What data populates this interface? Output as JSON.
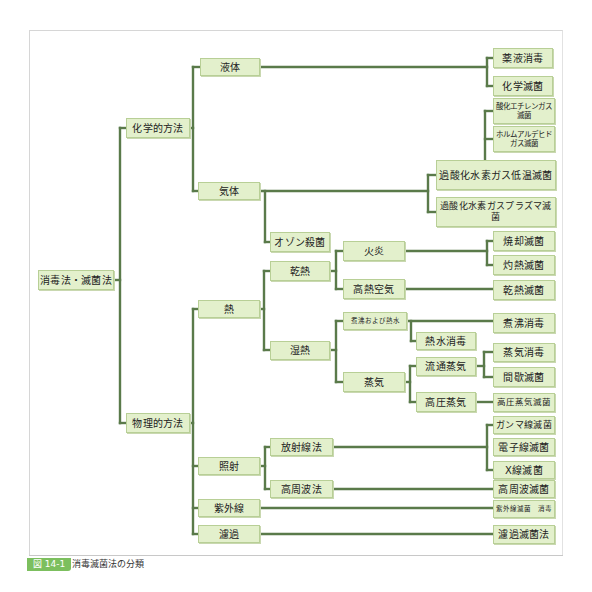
{
  "figure": {
    "caption_label": "図 14-1",
    "caption_title": "消毒滅菌法の分類"
  },
  "colors": {
    "line": "#5a7a4a",
    "node_fill": "#e3f0cc",
    "node_border": "#b8cf96",
    "caption_badge": "#7cbf5e"
  },
  "tree": {
    "root": "消毒法・滅菌法",
    "chemical": "化学的方法",
    "physical": "物理的方法",
    "liquid": "液体",
    "gas": "気体",
    "chem_disinfect": "薬液消毒",
    "chem_sterilize": "化学滅菌",
    "eo_gas": "酸化エチレンガス\n滅菌",
    "formaldehyde": "ホルムアルデヒド\nガス滅菌",
    "h2o2_lowtemp": "過酸化水素ガス低温滅菌",
    "h2o2_plasma": "過酸化水素ガスプラズマ滅菌",
    "ozone": "オゾン殺菌",
    "heat": "熱",
    "dry_heat": "乾熱",
    "flame": "火炎",
    "hot_air": "高熱空気",
    "incineration": "焼却滅菌",
    "flaming": "灼熱滅菌",
    "dry_heat_sterilize": "乾熱滅菌",
    "moist_heat": "湿熱",
    "boil_hot_water": "煮沸および熱水",
    "hot_water_disinfect": "熱水消毒",
    "boil_disinfect": "煮沸消毒",
    "steam": "蒸気",
    "flowing_steam": "流通蒸気",
    "steam_disinfect": "蒸気消毒",
    "intermittent": "間歇滅菌",
    "autoclave": "高圧蒸気",
    "autoclave_sterilize": "高圧蒸気滅菌",
    "irradiation": "照射",
    "radiation": "放射線法",
    "gamma": "ガンマ線滅菌",
    "electron": "電子線滅菌",
    "xray": "X線滅菌",
    "high_freq": "高周波法",
    "high_freq_sterilize": "高周波滅菌",
    "uv": "紫外線",
    "uv_result": "紫外線滅菌　消毒",
    "filtration": "濾過",
    "filtration_result": "濾過滅菌法"
  }
}
